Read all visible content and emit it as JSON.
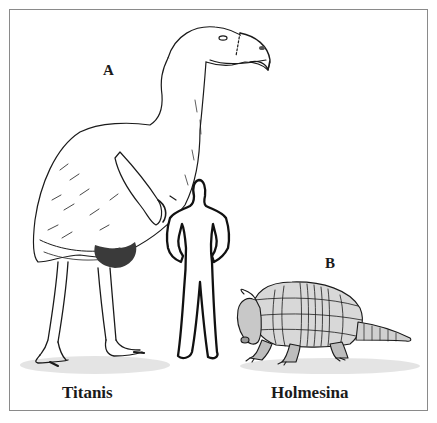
{
  "figure": {
    "panels": [
      {
        "letter": "A",
        "name": "Titanis",
        "subject": "terror-bird"
      },
      {
        "letter": "B",
        "name": "Holmesina",
        "subject": "giant-armadillo"
      }
    ],
    "scale_reference": "human-silhouette"
  },
  "colors": {
    "ink": "#1a1a1a",
    "border": "#8a8a8a",
    "background": "#ffffff"
  }
}
